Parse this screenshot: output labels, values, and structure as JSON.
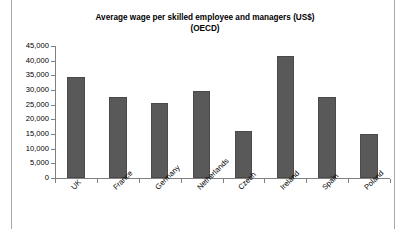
{
  "chart_data": {
    "type": "bar",
    "title": "Average wage per skilled employee and managers (US$)\n(OECD)",
    "title_line1": "Average wage per skilled employee and managers (US$)",
    "title_line2": "(OECD)",
    "xlabel": "",
    "ylabel": "",
    "categories": [
      "UK",
      "France",
      "Germany",
      "Netherlands",
      "Czech",
      "Ireland",
      "Spain",
      "Poland"
    ],
    "values": [
      34500,
      27500,
      25500,
      29500,
      16000,
      41500,
      27500,
      15000
    ],
    "ylim": [
      0,
      45000
    ],
    "ytick_values": [
      0,
      5000,
      10000,
      15000,
      20000,
      25000,
      30000,
      35000,
      40000,
      45000
    ],
    "ytick_labels": [
      "0",
      "5,000",
      "10,000",
      "15,000",
      "20,000",
      "25,000",
      "30,000",
      "35,000",
      "40,000",
      "45,000"
    ],
    "grid": false,
    "legend": false,
    "legend_position": "none",
    "bar_color": "#595959",
    "bar_border_color": "#4a4a4a",
    "axis_color": "#808080",
    "frame_color": "#a8a8a8",
    "background_color": "#ffffff",
    "series": [
      {
        "name": "Average wage (US$)",
        "values": [
          34500,
          27500,
          25500,
          29500,
          16000,
          41500,
          27500,
          15000
        ]
      }
    ]
  }
}
